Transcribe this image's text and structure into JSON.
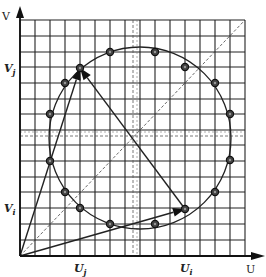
{
  "diagram": {
    "type": "geometric-construction",
    "axes": {
      "x_label": "U",
      "y_label": "V",
      "origin": [
        20,
        256
      ],
      "x_end": 245,
      "y_end": 20
    },
    "grid": {
      "x_lines": [
        20,
        35,
        50,
        65,
        80,
        95,
        110,
        125,
        140,
        155,
        170,
        185,
        200,
        215,
        230,
        245
      ],
      "y_lines": [
        20,
        36,
        52,
        67,
        83,
        99,
        114,
        130,
        145,
        161,
        177,
        192,
        208,
        224,
        240,
        256
      ],
      "color": "#222222"
    },
    "dashed_lines": {
      "vertical_x": 133,
      "horizontal_y": 136,
      "diagonal": [
        [
          20,
          256
        ],
        [
          245,
          20
        ]
      ]
    },
    "circle": {
      "cx": 140,
      "cy": 138,
      "r": 91
    },
    "points": [
      [
        110,
        52
      ],
      [
        155,
        52
      ],
      [
        185,
        67
      ],
      [
        215,
        83
      ],
      [
        230,
        114
      ],
      [
        230,
        160
      ],
      [
        215,
        192
      ],
      [
        185,
        209
      ],
      [
        155,
        224
      ],
      [
        110,
        224
      ],
      [
        80,
        208
      ],
      [
        65,
        192
      ],
      [
        50,
        161
      ],
      [
        50,
        114
      ],
      [
        65,
        83
      ],
      [
        80,
        68
      ]
    ],
    "vectors": [
      {
        "name": "vector-to-vj",
        "from": [
          20,
          256
        ],
        "to": [
          80,
          68
        ]
      },
      {
        "name": "vector-to-ui",
        "from": [
          20,
          256
        ],
        "to": [
          185,
          209
        ]
      },
      {
        "name": "vector-ui-to-vj",
        "from": [
          185,
          209
        ],
        "to": [
          80,
          68
        ]
      }
    ],
    "tick_labels": {
      "Vj": {
        "text": "V",
        "sub": "j",
        "x": 4,
        "y": 72
      },
      "Vi": {
        "text": "V",
        "sub": "i",
        "x": 4,
        "y": 212
      },
      "Uj": {
        "text": "U",
        "sub": "j",
        "x": 74,
        "y": 272
      },
      "Ui": {
        "text": "U",
        "sub": "i",
        "x": 180,
        "y": 272
      }
    }
  }
}
